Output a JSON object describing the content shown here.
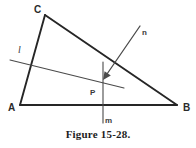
{
  "figure": {
    "caption": "Figure 15-28.",
    "vertices": [
      {
        "name": "A",
        "label": "A",
        "x": 20,
        "y": 105,
        "label_x": 11,
        "label_y": 110
      },
      {
        "name": "B",
        "label": "B",
        "x": 177,
        "y": 105,
        "label_x": 182,
        "label_y": 110
      },
      {
        "name": "C",
        "label": "C",
        "x": 45,
        "y": 15,
        "label_x": 35,
        "label_y": 12
      }
    ],
    "point": {
      "name": "P",
      "label": "P",
      "x": 100,
      "y": 82,
      "label_x": 92,
      "label_y": 93
    },
    "lines": [
      {
        "name": "l",
        "label": "l",
        "x1": 10,
        "y1": 60,
        "x2": 124,
        "y2": 88,
        "label_x": 19,
        "label_y": 51
      },
      {
        "name": "m",
        "label": "m",
        "x1": 103,
        "y1": 62,
        "x2": 103,
        "y2": 123,
        "label_x": 106,
        "label_y": 121
      }
    ],
    "ray": {
      "name": "n",
      "label": "n",
      "x1": 140,
      "y1": 26,
      "x2": 103,
      "y2": 80,
      "label_x": 141,
      "label_y": 33
    },
    "sides": [
      {
        "name": "side-AB",
        "x1": 20,
        "y1": 105,
        "x2": 177,
        "y2": 105
      },
      {
        "name": "side-AC",
        "x1": 20,
        "y1": 105,
        "x2": 45,
        "y2": 15
      },
      {
        "name": "side-CB",
        "x1": 45,
        "y1": 15,
        "x2": 177,
        "y2": 105
      }
    ],
    "colors": {
      "ink": "#262626",
      "aux_ink": "#4a4a4a",
      "background": "#ffffff"
    }
  }
}
